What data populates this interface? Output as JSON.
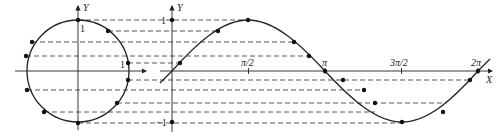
{
  "diagram": {
    "colors": {
      "line": "#222222",
      "dash": "#444444",
      "background": "#ffffff"
    },
    "circle": {
      "center": [
        78,
        71
      ],
      "radius": 51,
      "axis_labels": {
        "y": "Y"
      },
      "tick_labels": {
        "top": "1",
        "right": "1"
      },
      "points": [
        [
          78,
          20
        ],
        [
          108,
          31
        ],
        [
          32,
          42
        ],
        [
          26,
          56
        ],
        [
          128,
          63
        ],
        [
          128,
          80
        ],
        [
          27,
          90
        ],
        [
          117,
          103
        ],
        [
          44,
          112
        ],
        [
          78,
          123
        ]
      ]
    },
    "sine_graph": {
      "origin": [
        172,
        71
      ],
      "period_px": 306,
      "amplitude_px": 51,
      "axis_labels": {
        "x": "X",
        "y": "Y"
      },
      "y_ticks": [
        {
          "label": "1",
          "value": 1
        },
        {
          "label": "−1",
          "value": -1
        }
      ],
      "x_ticks": [
        {
          "label": "π/2",
          "value": "π/2"
        },
        {
          "label": "π",
          "value": "π"
        },
        {
          "label": "3π/2",
          "value": "3π/2"
        },
        {
          "label": "2π",
          "value": "2π"
        }
      ],
      "points": [
        [
          180,
          63
        ],
        [
          218,
          31
        ],
        [
          248,
          20
        ],
        [
          294,
          42
        ],
        [
          309,
          56
        ],
        [
          325,
          71
        ],
        [
          343,
          80
        ],
        [
          364,
          90
        ],
        [
          375,
          103
        ],
        [
          402,
          123
        ],
        [
          443,
          112
        ],
        [
          470,
          80
        ]
      ]
    },
    "projection_levels_y": [
      20,
      31,
      42,
      56,
      63,
      80,
      90,
      103,
      112,
      123
    ]
  },
  "labels": {
    "circle_y": "Y",
    "circle_top_one": "1",
    "circle_right_one": "1",
    "graph_y": "Y",
    "graph_x": "X",
    "graph_one": "1",
    "graph_neg_one": "−1",
    "pi_half": "π/2",
    "pi": "π",
    "three_pi_half": "3π/2",
    "two_pi": "2π"
  }
}
